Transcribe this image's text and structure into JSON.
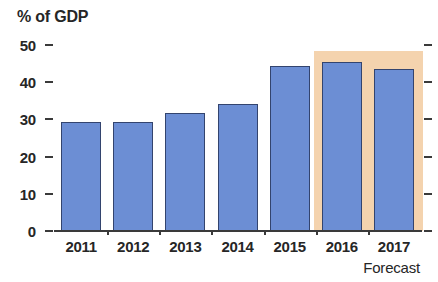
{
  "chart_data": {
    "type": "bar",
    "title": "% of GDP",
    "xlabel": "",
    "ylabel": "% of GDP",
    "categories": [
      "2011",
      "2012",
      "2013",
      "2014",
      "2015",
      "2016",
      "2017"
    ],
    "values": [
      29.4,
      29.4,
      31.7,
      34.2,
      44.4,
      45.3,
      43.6
    ],
    "series": [
      {
        "name": "% of GDP",
        "values": [
          29.4,
          29.4,
          31.7,
          34.2,
          44.4,
          45.3,
          43.6
        ]
      }
    ],
    "ylim": [
      0,
      50
    ],
    "yticks": [
      0,
      10,
      20,
      30,
      40,
      50
    ],
    "ytick_labels": [
      "0",
      "10",
      "20",
      "30",
      "40",
      "50"
    ],
    "grid": false,
    "legend": null,
    "legend_position": "none",
    "bar_color": "#6c8ed4",
    "bar_outline_color": "#33446e",
    "axis_color": "#3a3a3a",
    "text_color": "#262626",
    "background_color": "#ffffff",
    "annotations": [
      {
        "name": "forecast-band",
        "label": "Forecast",
        "covers": [
          "2016",
          "2017"
        ],
        "color": "#f4d3ae",
        "top_value": 48.5
      }
    ],
    "forecast_caption": "Forecast"
  }
}
